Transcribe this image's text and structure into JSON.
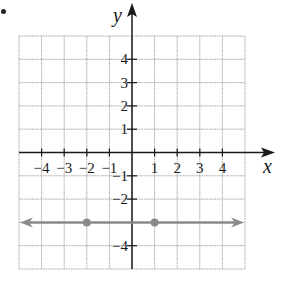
{
  "figure": {
    "bullet": "•",
    "axes": {
      "x_label": "x",
      "y_label": "y",
      "x_ticks": [
        {
          "value": -4,
          "label": "−4"
        },
        {
          "value": -3,
          "label": "−3"
        },
        {
          "value": -2,
          "label": "−2"
        },
        {
          "value": -1,
          "label": "−1"
        },
        {
          "value": 1,
          "label": "1"
        },
        {
          "value": 2,
          "label": "2"
        },
        {
          "value": 3,
          "label": "3"
        },
        {
          "value": 4,
          "label": "4"
        }
      ],
      "y_ticks": [
        {
          "value": 4,
          "label": "4"
        },
        {
          "value": 3,
          "label": "3"
        },
        {
          "value": 2,
          "label": "2"
        },
        {
          "value": 1,
          "label": "1"
        },
        {
          "value": -1,
          "label": "−1"
        },
        {
          "value": -2,
          "label": "−2"
        },
        {
          "value": -4,
          "label": "−4"
        }
      ],
      "grid_range": {
        "x": [
          -5,
          5
        ],
        "y": [
          -5,
          5
        ]
      }
    },
    "line": {
      "equation": "y = -3",
      "points": [
        {
          "x": -2,
          "y": -3
        },
        {
          "x": 1,
          "y": -3
        }
      ],
      "color": "#8a8a8a",
      "arrows": "both"
    },
    "colors": {
      "axis": "#1a1a1a",
      "grid": "#b5b5b5",
      "line": "#8a8a8a",
      "point": "#8a8a8a",
      "text": "#1a1a1a"
    }
  }
}
